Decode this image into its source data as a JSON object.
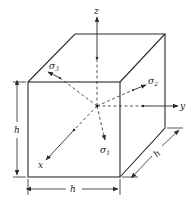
{
  "figure": {
    "axes": {
      "x": "x",
      "y": "y",
      "z": "z"
    },
    "stresses": {
      "sigma1": {
        "symbol": "σ",
        "subscript": "1"
      },
      "sigma2": {
        "symbol": "σ",
        "subscript": "2"
      },
      "sigma3": {
        "symbol": "σ",
        "subscript": "3"
      }
    },
    "dimensions": {
      "height": "h",
      "width": "h",
      "depth": "h"
    },
    "colors": {
      "line": "#2a2a2a",
      "background": "#ffffff"
    }
  }
}
